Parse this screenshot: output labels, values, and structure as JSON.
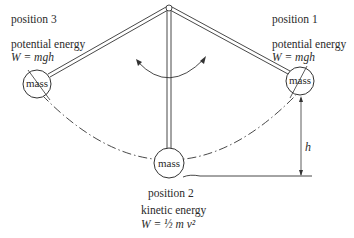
{
  "diagram": {
    "positions": [
      {
        "id": "position-3",
        "label": "position 3",
        "energy_type": "potential energy",
        "formula": "W = mgh",
        "mass_label": "mass"
      },
      {
        "id": "position-1",
        "label": "position 1",
        "energy_type": "potential energy",
        "formula": "W = mgh",
        "mass_label": "mass"
      },
      {
        "id": "position-2",
        "label": "position 2",
        "energy_type": "kinetic energy",
        "formula": "W = ½ m v²",
        "mass_label": "mass"
      }
    ],
    "height_label": "h",
    "swing_arrow": "double-headed arc",
    "colors": {
      "ink": "#2a2a2a",
      "background": "#ffffff"
    }
  }
}
